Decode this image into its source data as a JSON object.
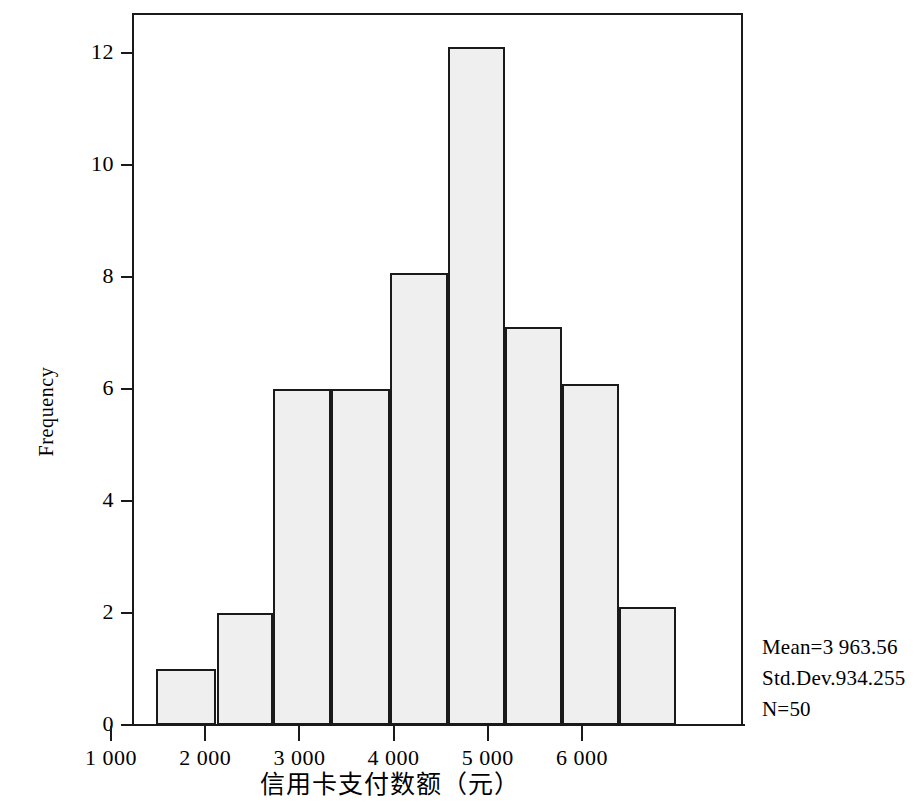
{
  "chart_data": {
    "type": "bar",
    "title": "",
    "subtitle": "",
    "xlabel": "信用卡支付数额（元）",
    "ylabel": "Frequency",
    "xlim": [
      700,
      6250
    ],
    "ylim": [
      0,
      12.8
    ],
    "grid": false,
    "legend": null,
    "x_tick_labels": [
      "1 000",
      "2 000",
      "3 000",
      "4 000",
      "5 000",
      "6 000"
    ],
    "x_tick_values": [
      1000,
      2000,
      3000,
      4000,
      5000,
      6000
    ],
    "y_tick_labels": [
      "0",
      "2",
      "4",
      "6",
      "8",
      "10",
      "12"
    ],
    "y_tick_values": [
      0,
      2,
      4,
      6,
      8,
      10,
      12
    ],
    "bin_edges": [
      1500,
      2100,
      2740,
      3380,
      4020,
      4660,
      5300,
      5940
    ],
    "bars": [
      {
        "bin_start": 1480,
        "bin_end": 2120,
        "value": 1
      },
      {
        "bin_start": 2120,
        "bin_end": 2720,
        "value": 2
      },
      {
        "bin_start": 2720,
        "bin_end": 3340,
        "value": 6
      },
      {
        "bin_start": 3340,
        "bin_end": 3960,
        "value": 6
      },
      {
        "bin_start": 3960,
        "bin_end": 4580,
        "value": 8.07
      },
      {
        "bin_start": 4580,
        "bin_end": 5180,
        "value": 12.1
      },
      {
        "bin_start": 5180,
        "bin_end": 5790,
        "value": 7.1
      },
      {
        "bin_start": 5790,
        "bin_end": 6390,
        "value": 6.09
      },
      {
        "bin_start": 6390,
        "bin_end": 7000,
        "value": 2.1
      }
    ],
    "values": [
      1,
      2,
      6,
      6,
      8.07,
      12.1,
      7.1,
      6.09,
      2.1
    ],
    "categories": [
      "1500-2100",
      "2100-2700",
      "2700-3300",
      "3300-3900",
      "3900-4500",
      "4500-5100",
      "5100-5700",
      "5700-6300",
      "6300-6900"
    ],
    "annotations": {
      "mean": "Mean=3 963.56",
      "std_dev": "Std.Dev.934.255",
      "n": "N=50"
    }
  },
  "axis": {
    "y_title": "Frequency",
    "x_title": "信用卡支付数额（元）",
    "y_ticks": [
      "12",
      "10",
      "8",
      "6",
      "4",
      "2",
      "0"
    ],
    "x_ticks": [
      "1 000",
      "2 000",
      "3 000",
      "4 000",
      "5 000",
      "6 000"
    ]
  },
  "stats": {
    "mean": "Mean=3 963.56",
    "std_dev": "Std.Dev.934.255",
    "n": "N=50"
  },
  "style": {
    "bar_fill": "#efefef",
    "bar_stroke": "#1a1a1a",
    "axis_color": "#1a1a1a",
    "background": "#ffffff"
  }
}
